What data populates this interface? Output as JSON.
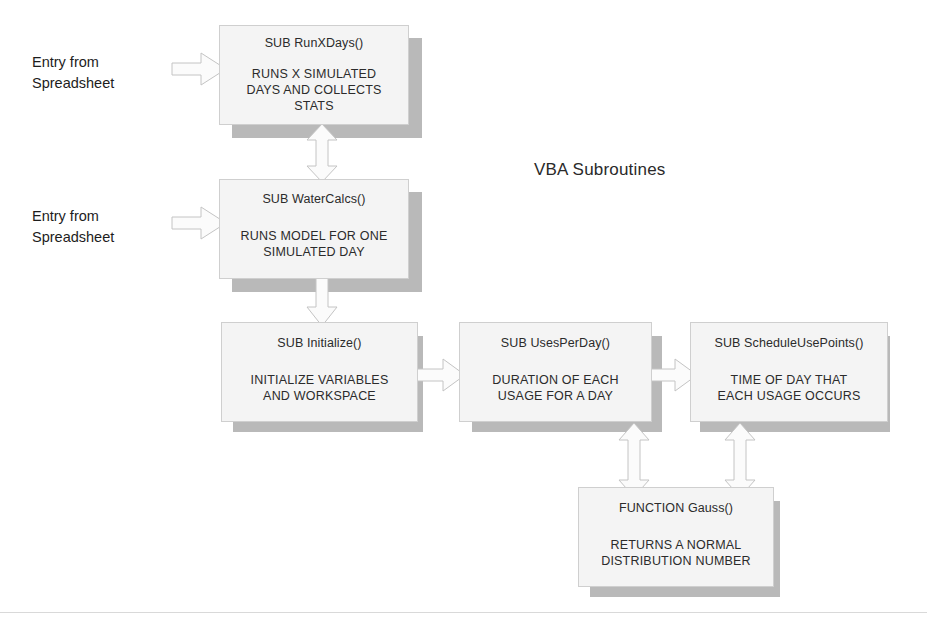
{
  "diagram": {
    "heading": "VBA Subroutines",
    "entry_labels": [
      {
        "text": "Entry from\nSpreadsheet"
      },
      {
        "text": "Entry from\nSpreadsheet"
      }
    ],
    "boxes": [
      {
        "id": "runxdays",
        "title": "SUB RunXDays()",
        "body": "RUNS X SIMULATED\nDAYS AND COLLECTS\nSTATS"
      },
      {
        "id": "watercalcs",
        "title": "SUB WaterCalcs()",
        "body": "RUNS MODEL FOR ONE\nSIMULATED DAY"
      },
      {
        "id": "initialize",
        "title": "SUB Initialize()",
        "body": "INITIALIZE VARIABLES\nAND WORKSPACE"
      },
      {
        "id": "usesperday",
        "title": "SUB UsesPerDay()",
        "body": "DURATION OF EACH\nUSAGE FOR A DAY"
      },
      {
        "id": "scheduleusepoints",
        "title": "SUB ScheduleUsePoints()",
        "body": "TIME OF DAY THAT\nEACH USAGE OCCURS"
      },
      {
        "id": "gauss",
        "title": "FUNCTION Gauss()",
        "body": "RETURNS A NORMAL\nDISTRIBUTION NUMBER"
      }
    ],
    "connectors": [
      {
        "id": "entry-to-runxdays",
        "kind": "right-arrow"
      },
      {
        "id": "entry-to-watercalcs",
        "kind": "right-arrow"
      },
      {
        "id": "runxdays-watercalcs",
        "kind": "double-vertical-arrow"
      },
      {
        "id": "watercalcs-initialize",
        "kind": "down-arrow"
      },
      {
        "id": "initialize-usesperday",
        "kind": "right-arrow"
      },
      {
        "id": "usesperday-scheduleusepoints",
        "kind": "right-arrow"
      },
      {
        "id": "usesperday-gauss",
        "kind": "double-vertical-arrow"
      },
      {
        "id": "scheduleusepoints-gauss",
        "kind": "double-vertical-arrow"
      }
    ],
    "colors": {
      "box_fill": "#f4f4f4",
      "box_border": "#cfcfcf",
      "shadow": "#b9b9b9",
      "arrow_fill": "#fbfbfb",
      "arrow_stroke": "#c4c4c4",
      "text": "#2b2b2b",
      "background": "#ffffff"
    }
  }
}
